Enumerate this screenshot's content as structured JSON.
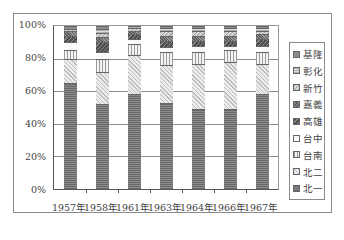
{
  "chart_data": {
    "type": "bar",
    "stacked": true,
    "percent": true,
    "title": "",
    "xlabel": "",
    "ylabel": "",
    "ylim": [
      0,
      100
    ],
    "grid": true,
    "legend_position": "right",
    "categories": [
      "1957年",
      "1958年",
      "1961年",
      "1963年",
      "1964年",
      "1966年",
      "1967年"
    ],
    "y_ticks": [
      "0%",
      "20%",
      "40%",
      "60%",
      "80%",
      "100%"
    ],
    "series": [
      {
        "name": "北一",
        "pattern": "dark-grid",
        "color": "#7a7a7a",
        "values": [
          65,
          52,
          58,
          53,
          49,
          49,
          58
        ]
      },
      {
        "name": "北二",
        "pattern": "light-stipple",
        "color": "#d4d4d4",
        "values": [
          15,
          20,
          24,
          23,
          28,
          29,
          19
        ]
      },
      {
        "name": "台南",
        "pattern": "vertical-lines",
        "color": "#f0f0f0",
        "values": [
          5,
          8,
          7,
          8,
          7,
          7,
          7
        ]
      },
      {
        "name": "台中",
        "pattern": "blank",
        "color": "#fafafa",
        "values": [
          5,
          4,
          3,
          3,
          4,
          3,
          4
        ]
      },
      {
        "name": "高雄",
        "pattern": "dark-mixed",
        "color": "#5e5e5e",
        "values": [
          4,
          6,
          3,
          4,
          3,
          3,
          4
        ]
      },
      {
        "name": "嘉義",
        "pattern": "dark-stipple",
        "color": "#7e7e7e",
        "values": [
          3,
          3,
          2,
          3,
          3,
          3,
          3
        ]
      },
      {
        "name": "新竹",
        "pattern": "medium-stipple",
        "color": "#b8b8b8",
        "values": [
          1,
          3,
          2,
          3,
          3,
          3,
          2
        ]
      },
      {
        "name": "彰化",
        "pattern": "light",
        "color": "#c8c8c8",
        "values": [
          0,
          2,
          1,
          2,
          2,
          2,
          2
        ]
      },
      {
        "name": "基隆",
        "pattern": "dark",
        "color": "#8c8c8c",
        "values": [
          2,
          2,
          0,
          1,
          1,
          1,
          1
        ]
      }
    ]
  },
  "legend": {
    "items": [
      "基隆",
      "彰化",
      "新竹",
      "嘉義",
      "高雄",
      "台中",
      "台南",
      "北二",
      "北一"
    ]
  }
}
